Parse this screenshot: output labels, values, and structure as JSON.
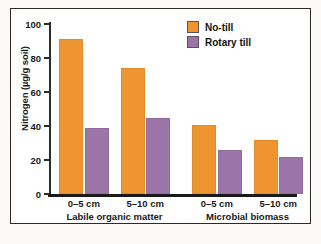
{
  "chart_data": {
    "type": "bar",
    "title": "",
    "xlabel": "",
    "ylabel": "Nitrogen (µg/g soil)",
    "ylim": [
      0,
      100
    ],
    "yticks": [
      0,
      20,
      40,
      60,
      80,
      100
    ],
    "ytick_labels": [
      "0",
      "20",
      "40",
      "60",
      "80",
      "100"
    ],
    "grid": false,
    "legend_position": "top-right",
    "categories": [
      "0–5 cm",
      "5–10 cm",
      "0–5 cm",
      "5–10 cm"
    ],
    "groups": [
      {
        "label": "Labile organic matter",
        "categories": [
          "0–5 cm",
          "5–10 cm"
        ]
      },
      {
        "label": "Microbial biomass",
        "categories": [
          "0–5 cm",
          "5–10 cm"
        ]
      }
    ],
    "series": [
      {
        "name": "No-till",
        "color": "#ee9430",
        "values": [
          91,
          74,
          40.5,
          32
        ]
      },
      {
        "name": "Rotary till",
        "color": "#9b74a8",
        "values": [
          39,
          44.5,
          26,
          22
        ]
      }
    ]
  },
  "legend": {
    "items": [
      {
        "label": "No-till",
        "color": "#ee9430"
      },
      {
        "label": "Rotary till",
        "color": "#9b74a8"
      }
    ]
  }
}
